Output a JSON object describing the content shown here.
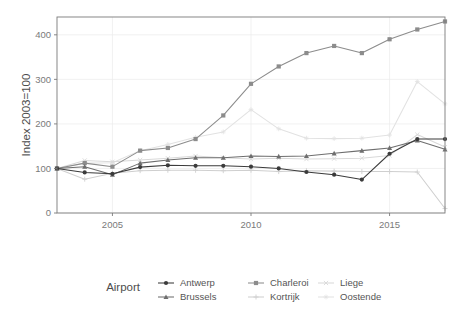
{
  "chart_data": {
    "type": "line",
    "title": "",
    "xlabel": "",
    "ylabel": "Index 2003=100",
    "xlim": [
      2003,
      2017
    ],
    "ylim": [
      0,
      440
    ],
    "xticks": [
      2005,
      2010,
      2015
    ],
    "yticks": [
      0,
      100,
      200,
      300,
      400
    ],
    "grid": true,
    "legend_position": "bottom",
    "legend_title": "Airport",
    "x": [
      2003,
      2004,
      2005,
      2006,
      2007,
      2008,
      2009,
      2010,
      2011,
      2012,
      2013,
      2014,
      2015,
      2016,
      2017
    ],
    "series": [
      {
        "name": "Antwerp",
        "marker": "circle",
        "color": "#3b3b3b",
        "values": [
          100,
          91,
          88,
          103,
          107,
          106,
          106,
          104,
          100,
          92,
          86,
          75,
          133,
          166,
          166
        ]
      },
      {
        "name": "Brussels",
        "marker": "triangle",
        "color": "#6e6e6e",
        "values": [
          100,
          104,
          86,
          112,
          119,
          124,
          124,
          128,
          127,
          128,
          134,
          140,
          146,
          163,
          143
        ]
      },
      {
        "name": "Charleroi",
        "marker": "square",
        "color": "#8c8c8c",
        "values": [
          100,
          112,
          104,
          140,
          146,
          166,
          219,
          290,
          329,
          359,
          375,
          359,
          390,
          412,
          430
        ]
      },
      {
        "name": "Kortrijk",
        "marker": "plus",
        "color": "#cfcfcf",
        "values": [
          100,
          76,
          89,
          95,
          96,
          96,
          95,
          96,
          93,
          95,
          94,
          93,
          93,
          92,
          10
        ]
      },
      {
        "name": "Liege",
        "marker": "cross",
        "color": "#d9d9d9",
        "values": [
          100,
          118,
          115,
          119,
          123,
          128,
          124,
          121,
          123,
          121,
          122,
          123,
          129,
          176,
          148
        ]
      },
      {
        "name": "Oostende",
        "marker": "star",
        "color": "#e2e2e2",
        "values": [
          100,
          112,
          113,
          140,
          154,
          170,
          182,
          232,
          189,
          168,
          167,
          168,
          175,
          295,
          245
        ]
      }
    ]
  },
  "axis": {
    "y_title": "Index 2003=100",
    "y_ticks": [
      "0",
      "100",
      "200",
      "300",
      "400"
    ],
    "x_ticks": [
      "2005",
      "2010",
      "2015"
    ]
  },
  "legend": {
    "title": "Airport",
    "entries": [
      {
        "label": "Antwerp"
      },
      {
        "label": "Brussels"
      },
      {
        "label": "Charleroi"
      },
      {
        "label": "Kortrijk"
      },
      {
        "label": "Liege"
      },
      {
        "label": "Oostende"
      }
    ]
  }
}
